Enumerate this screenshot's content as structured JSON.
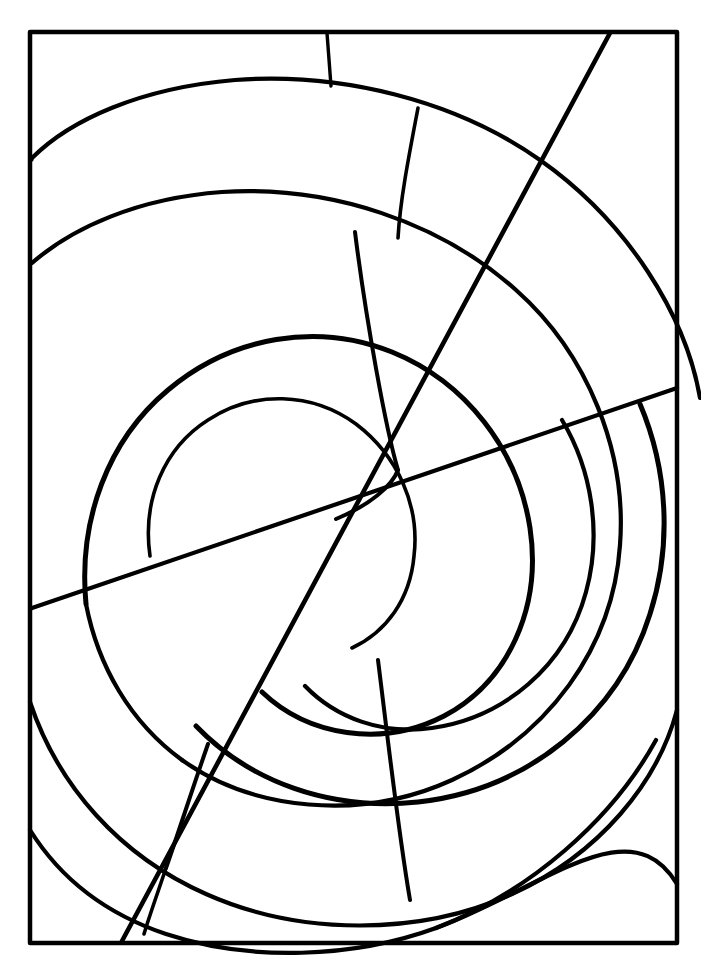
{
  "page": {
    "background_color": "#ffffff",
    "ink_color": "#000000",
    "caption_color": "#f2f2f2",
    "caption_text": "",
    "width": 701,
    "height": 972
  },
  "frame": {
    "name": "outer-border",
    "x": 30,
    "y": 32,
    "width": 647,
    "height": 911,
    "stroke_width": 4.5
  },
  "artwork": {
    "style": "line-art",
    "subject": "concentric spiral ovals with radial dividers",
    "convergence_point": {
      "x": 331,
      "y": 521
    },
    "stroke_widths": {
      "heavy": 5,
      "medium": 4,
      "light": 3
    },
    "element_counts": {
      "spiral_arcs": 7,
      "straight_lines": 2,
      "radial_dividers": 6
    }
  },
  "labels": {
    "frame": "outer-border",
    "artwork": "spiral-artwork",
    "caption": "page-caption"
  }
}
